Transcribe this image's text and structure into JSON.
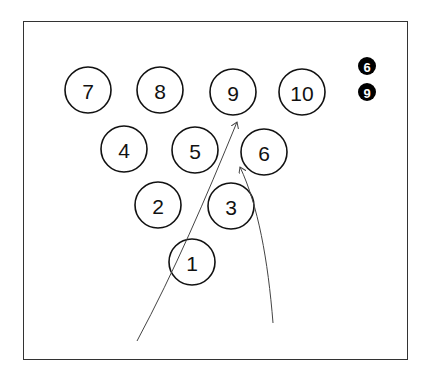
{
  "diagram": {
    "type": "bowling-pin-layout",
    "pins": [
      {
        "number": "7",
        "cx": 88,
        "cy": 90
      },
      {
        "number": "8",
        "cx": 160,
        "cy": 90
      },
      {
        "number": "9",
        "cx": 233,
        "cy": 92
      },
      {
        "number": "10",
        "cx": 302,
        "cy": 92
      },
      {
        "number": "4",
        "cx": 124,
        "cy": 149
      },
      {
        "number": "5",
        "cx": 195,
        "cy": 150
      },
      {
        "number": "6",
        "cx": 264,
        "cy": 152
      },
      {
        "number": "2",
        "cx": 158,
        "cy": 205
      },
      {
        "number": "3",
        "cx": 231,
        "cy": 206
      },
      {
        "number": "1",
        "cx": 192,
        "cy": 262
      }
    ],
    "pin_radius": 23,
    "legend_badges": [
      {
        "number": "6",
        "cx": 367,
        "cy": 66
      },
      {
        "number": "9",
        "cx": 367,
        "cy": 92
      }
    ],
    "badge_radius": 9,
    "arrows": [
      {
        "id": "ball-path-1",
        "from": [
          137,
          341
        ],
        "to": [
          237,
          122
        ],
        "d": "M137,341 C175,270 205,200 237,122"
      },
      {
        "id": "ball-path-2",
        "from": [
          273,
          323
        ],
        "to": [
          240,
          167
        ],
        "d": "M273,323 C268,260 258,205 240,167"
      }
    ],
    "colors": {
      "stroke": "#111111",
      "badge_fill": "#000000",
      "badge_text": "#ffffff",
      "frame": "#333333"
    }
  }
}
